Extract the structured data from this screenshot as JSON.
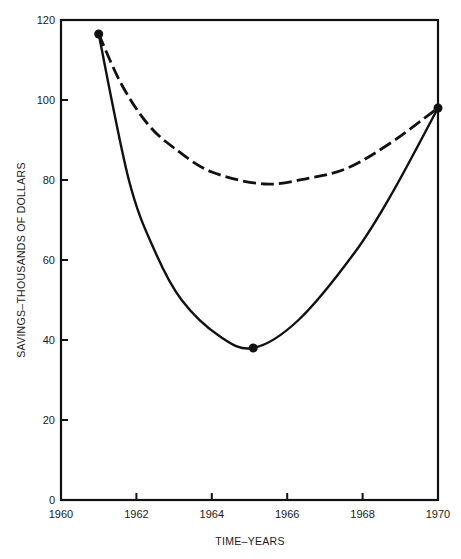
{
  "chart_data": {
    "type": "line",
    "title": "",
    "xlabel": "TIME–YEARS",
    "ylabel": "SAVINGS–THOUSANDS OF DOLLARS",
    "xlim": [
      1960,
      1970
    ],
    "ylim": [
      0,
      120
    ],
    "grid": false,
    "legend": null,
    "x_ticks": [
      "1960",
      "1962",
      "1964",
      "1966",
      "1968",
      "1970"
    ],
    "y_ticks": [
      "0",
      "20",
      "40",
      "60",
      "80",
      "100",
      "120"
    ],
    "series": [
      {
        "name": "solid curve",
        "style": "solid",
        "x": [
          1961.0,
          1961.8,
          1962.5,
          1963.2,
          1964.2,
          1965.1,
          1966.3,
          1967.8,
          1968.8,
          1970.0
        ],
        "y": [
          116.5,
          80,
          62,
          50,
          41,
          38,
          45,
          62,
          77,
          98
        ],
        "markers": [
          {
            "x": 1961.0,
            "y": 116.5
          },
          {
            "x": 1965.1,
            "y": 38
          },
          {
            "x": 1970.0,
            "y": 98
          }
        ]
      },
      {
        "name": "dashed curve",
        "style": "dashed",
        "x": [
          1961.0,
          1961.6,
          1962.3,
          1963.0,
          1964.0,
          1965.4,
          1966.6,
          1967.6,
          1968.7,
          1970.0
        ],
        "y": [
          116.5,
          104,
          94,
          88,
          82,
          79,
          80.5,
          83,
          89,
          98
        ],
        "markers": []
      }
    ]
  }
}
